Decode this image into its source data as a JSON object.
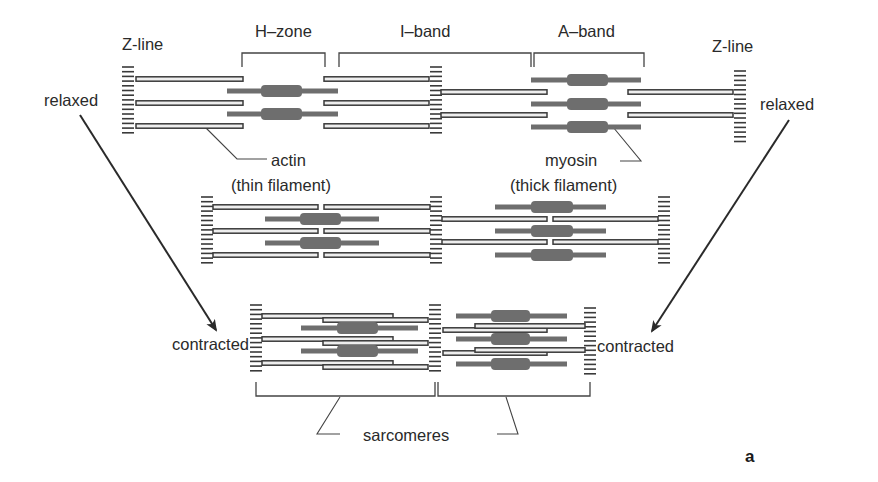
{
  "labels": {
    "z_line_left": "Z-line",
    "z_line_right": "Z-line",
    "h_zone": "H–zone",
    "i_band": "I–band",
    "a_band": "A–band",
    "relaxed_left": "relaxed",
    "relaxed_right": "relaxed",
    "actin": "actin",
    "actin_sub": "(thin filament)",
    "myosin": "myosin",
    "myosin_sub": "(thick filament)",
    "contracted_left": "contracted",
    "contracted_right": "contracted",
    "sarcomeres": "sarcomeres",
    "panel": "a"
  },
  "colors": {
    "actin_stroke": "#3a3a3a",
    "actin_fill": "#eeeeee",
    "myosin": "#6e6e6e",
    "z_line": "#3a3a3a",
    "text": "#2a2a2a",
    "leader": "#444444"
  },
  "rows": [
    {
      "name": "relaxed",
      "z_lines": [
        {
          "x": 128,
          "y0": 67,
          "y1": 137
        },
        {
          "x": 436,
          "y0": 67,
          "y1": 137
        },
        {
          "x": 740,
          "y0": 71,
          "y1": 142
        }
      ],
      "actin": [
        {
          "x0": 136,
          "x1": 243,
          "y": 79
        },
        {
          "x0": 136,
          "x1": 243,
          "y": 103
        },
        {
          "x0": 136,
          "x1": 243,
          "y": 126
        },
        {
          "x0": 324,
          "x1": 429,
          "y": 79
        },
        {
          "x0": 324,
          "x1": 429,
          "y": 103
        },
        {
          "x0": 324,
          "x1": 429,
          "y": 126
        },
        {
          "x0": 441,
          "x1": 547,
          "y": 92
        },
        {
          "x0": 441,
          "x1": 547,
          "y": 115
        },
        {
          "x0": 628,
          "x1": 733,
          "y": 92
        },
        {
          "x0": 628,
          "x1": 733,
          "y": 115
        }
      ],
      "myosin": [
        {
          "x0": 227,
          "x1": 338,
          "y": 91,
          "c0": 261,
          "c1": 302
        },
        {
          "x0": 227,
          "x1": 338,
          "y": 114,
          "c0": 261,
          "c1": 302
        },
        {
          "x0": 531,
          "x1": 641,
          "y": 80,
          "c0": 567,
          "c1": 608
        },
        {
          "x0": 531,
          "x1": 641,
          "y": 104,
          "c0": 567,
          "c1": 608
        },
        {
          "x0": 531,
          "x1": 641,
          "y": 127,
          "c0": 567,
          "c1": 608
        }
      ]
    },
    {
      "name": "intermediate",
      "z_lines": [
        {
          "x": 207,
          "y0": 197,
          "y1": 267
        },
        {
          "x": 436,
          "y0": 197,
          "y1": 267
        },
        {
          "x": 664,
          "y0": 197,
          "y1": 267
        }
      ],
      "actin": [
        {
          "x0": 213,
          "x1": 318,
          "y": 207
        },
        {
          "x0": 213,
          "x1": 318,
          "y": 231
        },
        {
          "x0": 213,
          "x1": 318,
          "y": 255
        },
        {
          "x0": 324,
          "x1": 430,
          "y": 207
        },
        {
          "x0": 324,
          "x1": 430,
          "y": 231
        },
        {
          "x0": 324,
          "x1": 430,
          "y": 255
        },
        {
          "x0": 442,
          "x1": 547,
          "y": 219
        },
        {
          "x0": 442,
          "x1": 547,
          "y": 242
        },
        {
          "x0": 553,
          "x1": 658,
          "y": 219
        },
        {
          "x0": 553,
          "x1": 658,
          "y": 242
        }
      ],
      "myosin": [
        {
          "x0": 265,
          "x1": 379,
          "y": 219,
          "c0": 300,
          "c1": 341
        },
        {
          "x0": 265,
          "x1": 379,
          "y": 243,
          "c0": 300,
          "c1": 341
        },
        {
          "x0": 495,
          "x1": 606,
          "y": 207,
          "c0": 531,
          "c1": 573
        },
        {
          "x0": 495,
          "x1": 606,
          "y": 231,
          "c0": 531,
          "c1": 573
        },
        {
          "x0": 495,
          "x1": 606,
          "y": 255,
          "c0": 531,
          "c1": 573
        }
      ]
    },
    {
      "name": "contracted",
      "z_lines": [
        {
          "x": 256,
          "y0": 305,
          "y1": 375
        },
        {
          "x": 435,
          "y0": 305,
          "y1": 375
        },
        {
          "x": 590,
          "y0": 308,
          "y1": 378
        }
      ],
      "actin": [
        {
          "x0": 262,
          "x1": 393,
          "y": 316
        },
        {
          "x0": 323,
          "x1": 428,
          "y": 320
        },
        {
          "x0": 262,
          "x1": 393,
          "y": 339
        },
        {
          "x0": 323,
          "x1": 428,
          "y": 343
        },
        {
          "x0": 262,
          "x1": 393,
          "y": 363
        },
        {
          "x0": 323,
          "x1": 428,
          "y": 367
        },
        {
          "x0": 443,
          "x1": 547,
          "y": 330
        },
        {
          "x0": 475,
          "x1": 585,
          "y": 326
        },
        {
          "x0": 443,
          "x1": 547,
          "y": 353
        },
        {
          "x0": 475,
          "x1": 585,
          "y": 350
        }
      ],
      "myosin": [
        {
          "x0": 301,
          "x1": 418,
          "y": 328,
          "c0": 337,
          "c1": 378
        },
        {
          "x0": 301,
          "x1": 418,
          "y": 351,
          "c0": 337,
          "c1": 378
        },
        {
          "x0": 456,
          "x1": 567,
          "y": 316,
          "c0": 491,
          "c1": 530
        },
        {
          "x0": 456,
          "x1": 567,
          "y": 339,
          "c0": 491,
          "c1": 530
        },
        {
          "x0": 456,
          "x1": 567,
          "y": 364,
          "c0": 491,
          "c1": 530
        }
      ]
    }
  ],
  "brackets": [
    {
      "name": "h-zone",
      "x0": 242,
      "x1": 325,
      "y": 53,
      "h": 14
    },
    {
      "name": "i-band",
      "x0": 339,
      "x1": 531,
      "y": 53,
      "h": 14
    },
    {
      "name": "a-band",
      "x0": 534,
      "x1": 644,
      "y": 53,
      "h": 14
    },
    {
      "name": "sarcomere-1",
      "x0": 256,
      "x1": 435,
      "y": 396,
      "h": 14,
      "down": true
    },
    {
      "name": "sarcomere-2",
      "x0": 438,
      "x1": 590,
      "y": 396,
      "h": 14,
      "down": true
    }
  ],
  "arrows": [
    {
      "name": "arrow-left",
      "x0": 80,
      "y0": 115,
      "x1": 216,
      "y1": 330
    },
    {
      "name": "arrow-right",
      "x0": 789,
      "y0": 120,
      "x1": 652,
      "y1": 331
    }
  ],
  "leaders": [
    {
      "name": "actin-leader",
      "points": [
        [
          205,
          127
        ],
        [
          237,
          159
        ],
        [
          267,
          159
        ]
      ]
    },
    {
      "name": "myosin-leader",
      "points": [
        [
          613,
          127
        ],
        [
          641,
          161
        ],
        [
          620,
          161
        ]
      ]
    },
    {
      "name": "sarcomere-leader-left",
      "points": [
        [
          340,
          397
        ],
        [
          317,
          434
        ],
        [
          340,
          434
        ]
      ]
    },
    {
      "name": "sarcomere-leader-right",
      "points": [
        [
          506,
          397
        ],
        [
          518,
          434
        ],
        [
          497,
          434
        ]
      ]
    }
  ]
}
